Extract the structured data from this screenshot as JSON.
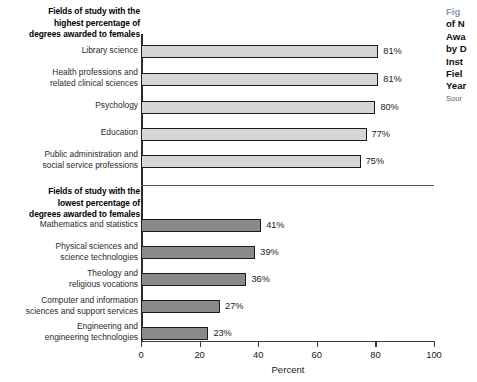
{
  "chart_data": {
    "type": "bar",
    "orientation": "horizontal",
    "title": "",
    "xlabel": "Percent",
    "ylabel": "",
    "xlim": [
      0,
      100
    ],
    "grid": false,
    "legend": null,
    "xticks": [
      0,
      20,
      40,
      60,
      80,
      100
    ],
    "xtick_labels": [
      "0",
      "20",
      "40",
      "60",
      "80",
      "100"
    ],
    "groups": [
      {
        "heading": "Fields of study with the highest percentage of degrees awarded to females",
        "bar_color": "#d6d6d6",
        "categories": [
          "Library science",
          "Health professions and related clinical sciences",
          "Psychology",
          "Education",
          "Public administration and social service professions"
        ],
        "values": [
          81,
          81,
          80,
          77,
          75
        ],
        "value_labels": [
          "81%",
          "81%",
          "80%",
          "77%",
          "75%"
        ]
      },
      {
        "heading": "Fields of study with the lowest percentage of degrees awarded to females",
        "bar_color": "#8a8a8a",
        "categories": [
          "Mathematics and statistics",
          "Physical sciences and science technologies",
          "Theology and religious vocations",
          "Computer and information sciences and support services",
          "Engineering and engineering technologies"
        ],
        "values": [
          41,
          39,
          36,
          27,
          23
        ],
        "value_labels": [
          "41%",
          "39%",
          "36%",
          "27%",
          "23%"
        ]
      }
    ]
  },
  "headings": {
    "high_line1": "Fields of study with the",
    "high_line2": "highest percentage of",
    "high_line3": "degrees awarded to females",
    "low_line1": "Fields of study with the",
    "low_line2": "lowest percentage of",
    "low_line3": "degrees awarded to females"
  },
  "category_labels": {
    "high": [
      [
        "Library science"
      ],
      [
        "Health professions and",
        "related clinical sciences"
      ],
      [
        "Psychology"
      ],
      [
        "Education"
      ],
      [
        "Public administration and",
        "social service professions"
      ]
    ],
    "low": [
      [
        "Mathematics and statistics"
      ],
      [
        "Physical sciences and",
        "science technologies"
      ],
      [
        "Theology and",
        "religious vocations"
      ],
      [
        "Computer and information",
        "sciences and support services"
      ],
      [
        "Engineering and",
        "engineering technologies"
      ]
    ]
  },
  "caption": {
    "figure_number": "Fig",
    "lines": [
      "of N",
      "Awa",
      "by D",
      "Inst",
      "Fiel",
      "Year"
    ],
    "source": "Sour"
  }
}
